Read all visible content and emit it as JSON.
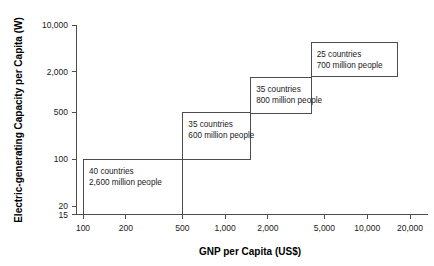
{
  "chart_data": {
    "type": "bar",
    "title": "",
    "subtitle": "",
    "xlabel": "GNP per Capita (US$)",
    "ylabel": "Electric-generating Capacity per Capita (W)",
    "xscale": "log",
    "yscale": "log",
    "xlim": [
      100,
      20000
    ],
    "ylim": [
      15,
      10000
    ],
    "grid": false,
    "legend": false,
    "x_ticks": [
      "100",
      "200",
      "500",
      "1,000",
      "2,000",
      "5,000",
      "10,000",
      "20,000"
    ],
    "x_tick_values": [
      100,
      200,
      500,
      1000,
      2000,
      5000,
      10000,
      20000
    ],
    "y_ticks": [
      "15",
      "20",
      "100",
      "500",
      "2,000",
      "10,000"
    ],
    "y_tick_values": [
      15,
      20,
      100,
      500,
      2000,
      10000
    ],
    "categories": [
      "40 countries",
      "35 countries",
      "35 countries",
      "25 countries"
    ],
    "steps": [
      {
        "countries": "40 countries",
        "population": "2,600 million people",
        "country_count": 40,
        "population_millions": 2600,
        "gnp_range": [
          100,
          500
        ],
        "capacity_range": [
          15,
          100
        ]
      },
      {
        "countries": "35 countries",
        "population": "600 million people",
        "country_count": 35,
        "population_millions": 600,
        "gnp_range": [
          500,
          1500
        ],
        "capacity_range": [
          100,
          500
        ]
      },
      {
        "countries": "35 countries",
        "population": "800 million people",
        "country_count": 35,
        "population_millions": 800,
        "gnp_range": [
          1500,
          4000
        ],
        "capacity_range": [
          500,
          1700
        ]
      },
      {
        "countries": "25 countries",
        "population": "700 million people",
        "country_count": 25,
        "population_millions": 700,
        "gnp_range": [
          4000,
          16000
        ],
        "capacity_range": [
          1700,
          5500
        ]
      }
    ],
    "colors": {
      "axis": "#4d4d4d",
      "box_stroke": "#4d4d4d",
      "text": "#1a1a1a",
      "background": "#ffffff"
    }
  }
}
